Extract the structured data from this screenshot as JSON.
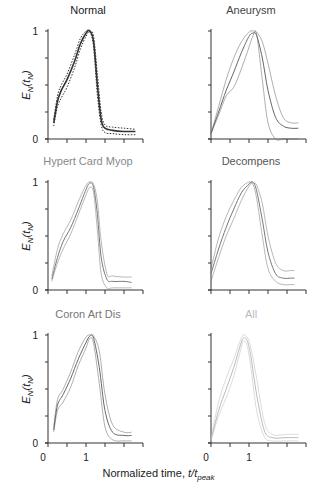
{
  "chart_data": [
    {
      "type": "line",
      "title": "Normal",
      "title_color": "#222222",
      "line_color": "#333333",
      "xlabel": "Normalized time, t/t_peak",
      "ylabel": "E_N(t_N)",
      "xlim": [
        0,
        2.3
      ],
      "ylim": [
        0,
        1
      ],
      "x": [
        0.15,
        0.25,
        0.35,
        0.5,
        0.7,
        0.85,
        1.0,
        1.1,
        1.2,
        1.3,
        1.4,
        1.5,
        1.7,
        2.0,
        2.3
      ],
      "series": [
        {
          "name": "mean",
          "style": "solid",
          "values": [
            0.15,
            0.35,
            0.45,
            0.55,
            0.72,
            0.88,
            0.98,
            1.0,
            0.9,
            0.5,
            0.18,
            0.1,
            0.08,
            0.07,
            0.07
          ]
        },
        {
          "name": "upper",
          "style": "dotted",
          "values": [
            0.18,
            0.4,
            0.5,
            0.6,
            0.78,
            0.93,
            1.0,
            1.0,
            0.95,
            0.6,
            0.25,
            0.13,
            0.11,
            0.1,
            0.09
          ]
        },
        {
          "name": "lower",
          "style": "dotted",
          "values": [
            0.12,
            0.3,
            0.38,
            0.48,
            0.66,
            0.83,
            0.95,
            0.99,
            0.85,
            0.4,
            0.13,
            0.06,
            0.05,
            0.04,
            0.04
          ]
        }
      ]
    },
    {
      "type": "line",
      "title": "Aneurysm",
      "title_color": "#444444",
      "line_color": "#666666",
      "xlim": [
        0,
        2.3
      ],
      "ylim": [
        0,
        1
      ],
      "x": [
        0.0,
        0.2,
        0.4,
        0.6,
        0.8,
        1.0,
        1.1,
        1.2,
        1.35,
        1.5,
        1.7,
        1.9,
        2.1,
        2.3
      ],
      "series": [
        {
          "name": "mean",
          "style": "solid",
          "values": [
            0.05,
            0.25,
            0.45,
            0.62,
            0.8,
            0.95,
            0.98,
            0.96,
            0.75,
            0.45,
            0.2,
            0.12,
            0.1,
            0.1
          ]
        },
        {
          "name": "upper",
          "style": "thin",
          "values": [
            0.05,
            0.3,
            0.55,
            0.75,
            0.9,
            0.99,
            1.0,
            0.99,
            0.9,
            0.7,
            0.4,
            0.2,
            0.15,
            0.15
          ]
        },
        {
          "name": "lower",
          "style": "thin",
          "values": [
            0.05,
            0.22,
            0.4,
            0.48,
            0.65,
            0.85,
            0.95,
            0.97,
            0.55,
            0.15,
            0.0,
            0.0,
            0.0,
            0.0
          ]
        }
      ]
    },
    {
      "type": "line",
      "title": "Hypert Card Myop",
      "title_color": "#888888",
      "line_color": "#777777",
      "xlim": [
        0,
        2.3
      ],
      "ylim": [
        0,
        1
      ],
      "x": [
        0.1,
        0.25,
        0.4,
        0.6,
        0.8,
        1.0,
        1.1,
        1.2,
        1.3,
        1.4,
        1.55,
        1.7,
        2.0,
        2.2
      ],
      "series": [
        {
          "name": "mean",
          "style": "solid",
          "values": [
            0.1,
            0.3,
            0.45,
            0.58,
            0.75,
            0.93,
            0.99,
            0.95,
            0.7,
            0.3,
            0.1,
            0.08,
            0.08,
            0.07
          ]
        },
        {
          "name": "upper",
          "style": "thin",
          "values": [
            0.13,
            0.38,
            0.52,
            0.65,
            0.82,
            0.97,
            1.0,
            0.98,
            0.82,
            0.45,
            0.15,
            0.13,
            0.12,
            0.12
          ]
        },
        {
          "name": "lower",
          "style": "thin",
          "values": [
            0.08,
            0.25,
            0.38,
            0.52,
            0.7,
            0.88,
            0.95,
            0.9,
            0.55,
            0.15,
            0.02,
            0.02,
            0.02,
            0.02
          ]
        }
      ]
    },
    {
      "type": "line",
      "title": "Decompens",
      "title_color": "#555555",
      "line_color": "#777777",
      "xlim": [
        0,
        2.3
      ],
      "ylim": [
        0,
        1
      ],
      "x": [
        0.0,
        0.2,
        0.4,
        0.6,
        0.8,
        1.0,
        1.1,
        1.2,
        1.35,
        1.5,
        1.7,
        1.9,
        2.1,
        2.2
      ],
      "series": [
        {
          "name": "mean",
          "style": "solid",
          "values": [
            0.15,
            0.38,
            0.58,
            0.75,
            0.9,
            0.98,
            1.0,
            0.92,
            0.65,
            0.35,
            0.15,
            0.11,
            0.11,
            0.11
          ]
        },
        {
          "name": "upper",
          "style": "thin",
          "values": [
            0.2,
            0.48,
            0.68,
            0.83,
            0.95,
            1.0,
            0.99,
            0.97,
            0.8,
            0.5,
            0.25,
            0.18,
            0.18,
            0.18
          ]
        },
        {
          "name": "lower",
          "style": "thin",
          "values": [
            0.08,
            0.3,
            0.5,
            0.66,
            0.83,
            0.96,
            0.98,
            0.85,
            0.5,
            0.2,
            0.08,
            0.05,
            0.05,
            0.05
          ]
        }
      ]
    },
    {
      "type": "line",
      "title": "Coron Art Dis",
      "title_color": "#777777",
      "line_color": "#666666",
      "xlim": [
        0,
        2.3
      ],
      "ylim": [
        0,
        1
      ],
      "x": [
        0.15,
        0.25,
        0.4,
        0.6,
        0.8,
        1.0,
        1.1,
        1.2,
        1.35,
        1.5,
        1.7,
        2.0,
        2.2
      ],
      "series": [
        {
          "name": "mean",
          "style": "solid",
          "values": [
            0.12,
            0.35,
            0.45,
            0.6,
            0.78,
            0.93,
            0.99,
            0.97,
            0.7,
            0.3,
            0.1,
            0.07,
            0.07
          ]
        },
        {
          "name": "upper",
          "style": "thin",
          "values": [
            0.15,
            0.4,
            0.5,
            0.66,
            0.85,
            0.98,
            1.0,
            0.99,
            0.85,
            0.45,
            0.17,
            0.1,
            0.1
          ]
        },
        {
          "name": "lower",
          "style": "thin",
          "values": [
            0.1,
            0.3,
            0.38,
            0.52,
            0.72,
            0.88,
            0.97,
            0.92,
            0.55,
            0.15,
            0.03,
            0.02,
            0.02
          ]
        }
      ]
    },
    {
      "type": "line",
      "title": "All",
      "title_color": "#bbbbbb",
      "line_color": "#bbbbbb",
      "xlim": [
        0,
        2.3
      ],
      "ylim": [
        0,
        1
      ],
      "x": [
        0.0,
        0.2,
        0.4,
        0.6,
        0.75,
        0.85,
        0.95,
        1.05,
        1.2,
        1.4,
        1.6,
        2.0,
        2.3
      ],
      "series": [
        {
          "name": "mean",
          "style": "solid",
          "values": [
            0.03,
            0.3,
            0.5,
            0.7,
            0.88,
            0.97,
            0.95,
            0.8,
            0.45,
            0.12,
            0.05,
            0.05,
            0.05
          ]
        },
        {
          "name": "upper",
          "style": "thin",
          "values": [
            0.05,
            0.38,
            0.6,
            0.78,
            0.93,
            1.0,
            0.98,
            0.88,
            0.6,
            0.2,
            0.08,
            0.08,
            0.08
          ]
        },
        {
          "name": "lower",
          "style": "thin",
          "values": [
            0.02,
            0.25,
            0.42,
            0.62,
            0.82,
            0.94,
            0.9,
            0.7,
            0.3,
            0.06,
            0.02,
            0.02,
            0.02
          ]
        }
      ]
    }
  ],
  "figure": {
    "ylabel_main": "E",
    "ylabel_sub": "N",
    "ylabel_arg": "(t",
    "ylabel_arg_sub": "N",
    "ylabel_close": ")",
    "ytick_labels": [
      "0",
      "1"
    ],
    "xtick_labels": [
      "0",
      "1"
    ],
    "xlabel_prefix": "Normalized time, ",
    "xlabel_var": "t/t",
    "xlabel_sub": "peak"
  }
}
